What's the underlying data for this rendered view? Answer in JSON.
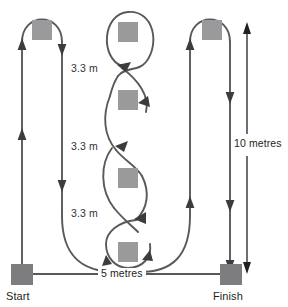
{
  "diagram": {
    "type": "course-plan",
    "colors": {
      "path": "#59595b",
      "cone": "#9a9a9c",
      "terminal_marker": "#7d7d80",
      "dimension": "#231f20",
      "background": "#ffffff"
    },
    "terminals": [
      {
        "id": "start",
        "label": "Start",
        "x": 22,
        "y": 274
      },
      {
        "id": "finish",
        "label": "Finish",
        "x": 230,
        "y": 274
      }
    ],
    "cones": [
      {
        "id": "cone-left-top",
        "x": 42,
        "y": 30
      },
      {
        "id": "cone-center-1",
        "x": 128,
        "y": 32
      },
      {
        "id": "cone-center-2",
        "x": 128,
        "y": 100
      },
      {
        "id": "cone-center-3",
        "x": 128,
        "y": 178
      },
      {
        "id": "cone-center-4",
        "x": 128,
        "y": 252
      },
      {
        "id": "cone-right-top",
        "x": 212,
        "y": 30
      }
    ],
    "gap_labels": [
      {
        "id": "gap-1",
        "text": "3.3 m"
      },
      {
        "id": "gap-2",
        "text": "3.3 m"
      },
      {
        "id": "gap-3",
        "text": "3.3 m"
      }
    ],
    "dimensions": [
      {
        "id": "vertical-dimension",
        "text": "10 metres",
        "orientation": "vertical",
        "value": 10,
        "unit": "metres"
      },
      {
        "id": "horizontal-dimension",
        "text": "5 metres",
        "orientation": "horizontal",
        "value": 5,
        "unit": "metres"
      }
    ],
    "cone_spacing": {
      "value": 3.3,
      "unit": "m",
      "text": "3.3 m"
    }
  }
}
